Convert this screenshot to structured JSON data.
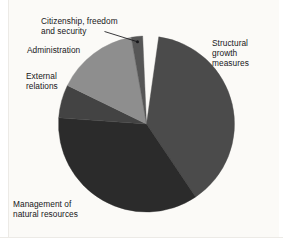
{
  "figure": {
    "background_color": "#fbfaf7",
    "text_color": "#17171a"
  },
  "chart_data": {
    "type": "pie",
    "title": "",
    "subtitle": "",
    "xlabel": "",
    "ylabel": "",
    "legend_position": "none",
    "labels_position": "outside-with-leader",
    "grid": false,
    "center": {
      "x": 146.5,
      "y": 124
    },
    "radius": 88,
    "start_angle_deg": 8,
    "direction": "clockwise",
    "categories": [
      "Structural growth measures",
      "Management of natural resources",
      "External relations",
      "Administration",
      "Citizenship, freedom and security"
    ],
    "values": [
      38,
      36,
      6,
      15,
      2
    ],
    "slices": [
      {
        "label": "Structural\ngrowth\nmeasures",
        "label_flat": "Structural growth measures",
        "value": 38,
        "color": "#4b4b4b",
        "start_angle_deg": 8,
        "end_angle_deg": 146,
        "leader_line": false
      },
      {
        "label": "Management of\nnatural resources",
        "label_flat": "Management of natural resources",
        "value": 36,
        "color": "#2b2b2b",
        "start_angle_deg": 146,
        "end_angle_deg": 274,
        "leader_line": false
      },
      {
        "label": "External\nrelations",
        "label_flat": "External relations",
        "value": 6,
        "color": "#434343",
        "start_angle_deg": 274,
        "end_angle_deg": 296,
        "leader_line": false
      },
      {
        "label": "Administration",
        "label_flat": "Administration",
        "value": 15,
        "color": "#8e8e8e",
        "start_angle_deg": 296,
        "end_angle_deg": 350,
        "leader_line": false
      },
      {
        "label": "Citizenship, freedom\nand security",
        "label_flat": "Citizenship, freedom and security",
        "value": 2,
        "color": "#565656",
        "start_angle_deg": 350,
        "end_angle_deg": 357.5,
        "leader_line": true
      }
    ]
  }
}
